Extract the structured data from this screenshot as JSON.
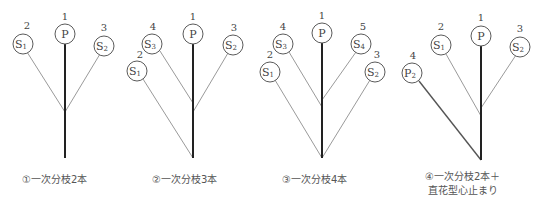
{
  "panels": [
    {
      "id": 1,
      "caption": "①一次分枝2本",
      "nodes": [
        {
          "key": "P",
          "label": "P",
          "sub": "",
          "number": "1"
        },
        {
          "key": "S1",
          "label": "S",
          "sub": "1",
          "number": "2"
        },
        {
          "key": "S2",
          "label": "S",
          "sub": "2",
          "number": "3"
        }
      ]
    },
    {
      "id": 2,
      "caption": "②一次分枝3本",
      "nodes": [
        {
          "key": "P",
          "label": "P",
          "sub": "",
          "number": "1"
        },
        {
          "key": "S1",
          "label": "S",
          "sub": "1",
          "number": "2"
        },
        {
          "key": "S2",
          "label": "S",
          "sub": "2",
          "number": "3"
        },
        {
          "key": "S3",
          "label": "S",
          "sub": "3",
          "number": "4"
        }
      ]
    },
    {
      "id": 3,
      "caption": "③一次分枝4本",
      "nodes": [
        {
          "key": "P",
          "label": "P",
          "sub": "",
          "number": "1"
        },
        {
          "key": "S1",
          "label": "S",
          "sub": "1",
          "number": "2"
        },
        {
          "key": "S2",
          "label": "S",
          "sub": "2",
          "number": "3"
        },
        {
          "key": "S3",
          "label": "S",
          "sub": "3",
          "number": "4"
        },
        {
          "key": "S4",
          "label": "S",
          "sub": "4",
          "number": "5"
        }
      ]
    },
    {
      "id": 4,
      "caption_line1": "④一次分枝2本＋",
      "caption_line2": "直花型心止まり",
      "nodes": [
        {
          "key": "P",
          "label": "P",
          "sub": "",
          "number": "1"
        },
        {
          "key": "S1",
          "label": "S",
          "sub": "1",
          "number": "2"
        },
        {
          "key": "S2",
          "label": "S",
          "sub": "2",
          "number": "3"
        },
        {
          "key": "P2",
          "label": "P",
          "sub": "2",
          "number": "4"
        }
      ]
    }
  ]
}
